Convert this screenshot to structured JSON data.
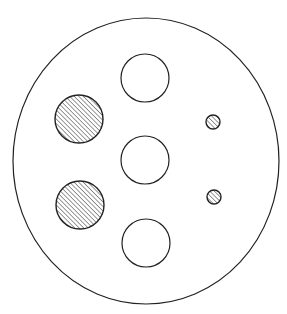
{
  "diagram": {
    "type": "circular-plate-with-holes",
    "colors": {
      "stroke": "#222222",
      "background": "#ffffff",
      "hatch": "#333333"
    },
    "outer": {
      "cx": 146,
      "cy": 161,
      "rx": 133,
      "ry": 143
    },
    "open_circles": [
      {
        "name": "open-circle-top",
        "cx": 145,
        "cy": 78,
        "r": 24
      },
      {
        "name": "open-circle-middle",
        "cx": 145,
        "cy": 160,
        "r": 24
      },
      {
        "name": "open-circle-bottom",
        "cx": 146,
        "cy": 243,
        "r": 24
      }
    ],
    "hatched_circles": [
      {
        "name": "hatched-circle-upper-left",
        "cx": 79,
        "cy": 119,
        "r": 24
      },
      {
        "name": "hatched-circle-lower-left",
        "cx": 80,
        "cy": 205,
        "r": 24
      },
      {
        "name": "small-hatched-circle-upper-right",
        "cx": 213,
        "cy": 122,
        "r": 7
      },
      {
        "name": "small-hatched-circle-lower-right",
        "cx": 214,
        "cy": 197,
        "r": 7
      }
    ]
  }
}
